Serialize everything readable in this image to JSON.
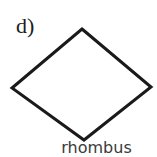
{
  "figure": {
    "part_label": "d)",
    "caption": "rhombus",
    "background_color": "#ffffff",
    "stroke_color": "#1a1a1a",
    "stroke_width": 3,
    "label_color": "#1c1c1c",
    "caption_color": "#3a3a3a"
  },
  "chart_data": {
    "type": "diagram",
    "shape": "rhombus",
    "title": "d)",
    "caption": "rhombus",
    "fill": "none",
    "stroke": "#1a1a1a",
    "vertices": [
      {
        "name": "top",
        "x": 82,
        "y": 29
      },
      {
        "name": "right",
        "x": 151,
        "y": 87
      },
      {
        "name": "bottom",
        "x": 84,
        "y": 140
      },
      {
        "name": "left",
        "x": 12,
        "y": 88
      }
    ],
    "points_attr": "82,29 151,87 84,140 12,88"
  }
}
